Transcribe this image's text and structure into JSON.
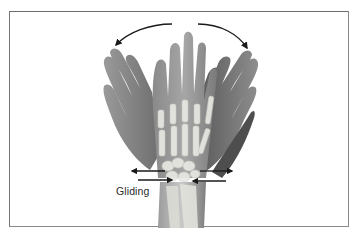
{
  "figure": {
    "type": "anatomical illustration",
    "labels": {
      "gliding": "Gliding"
    },
    "arrows": {
      "top_left": "curved arrow indicating radial deviation",
      "top_right": "curved arrow indicating ulnar deviation",
      "carpal": "four horizontal arrows indicating gliding of carpal bones"
    },
    "colors": {
      "frame": "#7a7a7a",
      "arrow": "#1a1a1a",
      "skin_dark": "#5e5e5e",
      "skin_mid": "#8c8c8c",
      "bone": "#e6e6e2",
      "background": "#ffffff"
    }
  }
}
